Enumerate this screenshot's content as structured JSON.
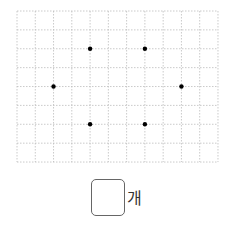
{
  "grid": {
    "left": 17,
    "top": 11,
    "cols": 11,
    "rows": 8,
    "cell_w": 18.27,
    "cell_h": 18.88,
    "line_color": "#bdbdbd",
    "dot_color": "#000000",
    "dot_radius": 2.2,
    "dots": [
      {
        "col": 4,
        "row": 2
      },
      {
        "col": 7,
        "row": 2
      },
      {
        "col": 2,
        "row": 4
      },
      {
        "col": 9,
        "row": 4
      },
      {
        "col": 4,
        "row": 6
      },
      {
        "col": 7,
        "row": 6
      }
    ]
  },
  "answer": {
    "value": "",
    "unit": "개"
  }
}
